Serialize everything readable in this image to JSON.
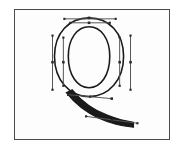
{
  "app": {
    "title": "Glyph Outline Editor",
    "view": "glyph-canvas"
  },
  "canvas": {
    "frame_label": "glyph editing canvas",
    "background_color": "#fdfdfd",
    "border_color": "#4a4a4a",
    "outline_color": "#1a1a1a",
    "handle_color": "#555555",
    "point_color": "#2b2b2b"
  },
  "glyph": {
    "character": "Q",
    "name": "Q",
    "style": "serif-capital",
    "description": "Capital letter Q outline with Bezier control points and handles"
  },
  "contours": [
    {
      "name": "outer-bowl",
      "path": "M 89 17 C 109 17 124 32 124 56 C 124 80 109 97 89 97 C 69 97 54 80 54 56 C 54 32 69 17 89 17 Z"
    },
    {
      "name": "inner-counter",
      "path": "M 89 26 C 101 26 110 38 110 56 C 110 75 101 88 89 88 C 77 88 68 75 68 56 C 68 38 77 26 89 26 Z"
    },
    {
      "name": "tail-stroke",
      "path": "M 72 90 C 80 100 92 110 108 116 C 118 120 126 122 134 123 L 134 128 C 122 127 110 124 99 119 C 84 112 73 102 66 93 Z"
    }
  ],
  "handles": [
    {
      "name": "handle-top-outer",
      "x1": 64,
      "y1": 18,
      "x2": 116,
      "y2": 18
    },
    {
      "name": "handle-top-inner",
      "x1": 70,
      "y1": 22,
      "x2": 110,
      "y2": 22
    },
    {
      "name": "handle-left-outer",
      "x1": 52,
      "y1": 35,
      "x2": 52,
      "y2": 90
    },
    {
      "name": "handle-left-inner",
      "x1": 63,
      "y1": 37,
      "x2": 63,
      "y2": 86
    },
    {
      "name": "handle-right-inner",
      "x1": 120,
      "y1": 37,
      "x2": 120,
      "y2": 86
    },
    {
      "name": "handle-right-outer",
      "x1": 131,
      "y1": 35,
      "x2": 131,
      "y2": 90
    },
    {
      "name": "handle-tail-upper",
      "x1": 68,
      "y1": 95,
      "x2": 112,
      "y2": 99
    },
    {
      "name": "handle-tail-lower",
      "x1": 86,
      "y1": 117,
      "x2": 138,
      "y2": 124
    }
  ],
  "control_points": [
    {
      "name": "point-top-left-handle",
      "x": 64,
      "y": 18,
      "type": "handle-end"
    },
    {
      "name": "point-top-apex",
      "x": 89,
      "y": 17,
      "type": "on-curve"
    },
    {
      "name": "point-top-right-handle",
      "x": 116,
      "y": 18,
      "type": "handle-end"
    },
    {
      "name": "point-inner-top-left",
      "x": 70,
      "y": 22,
      "type": "handle-end"
    },
    {
      "name": "point-inner-top-apex",
      "x": 89,
      "y": 22,
      "type": "on-curve"
    },
    {
      "name": "point-inner-top-right",
      "x": 110,
      "y": 22,
      "type": "handle-end"
    },
    {
      "name": "point-left-outer-top",
      "x": 52,
      "y": 35,
      "type": "handle-end"
    },
    {
      "name": "point-left-outer-mid",
      "x": 52,
      "y": 62,
      "type": "on-curve"
    },
    {
      "name": "point-left-outer-bottom",
      "x": 52,
      "y": 90,
      "type": "handle-end"
    },
    {
      "name": "point-left-inner-top",
      "x": 63,
      "y": 37,
      "type": "handle-end"
    },
    {
      "name": "point-left-inner-mid",
      "x": 63,
      "y": 62,
      "type": "on-curve"
    },
    {
      "name": "point-left-inner-bottom",
      "x": 63,
      "y": 86,
      "type": "handle-end"
    },
    {
      "name": "point-right-inner-top",
      "x": 120,
      "y": 37,
      "type": "handle-end"
    },
    {
      "name": "point-right-inner-mid",
      "x": 120,
      "y": 62,
      "type": "on-curve"
    },
    {
      "name": "point-right-inner-bottom",
      "x": 120,
      "y": 86,
      "type": "handle-end"
    },
    {
      "name": "point-right-outer-top",
      "x": 131,
      "y": 35,
      "type": "handle-end"
    },
    {
      "name": "point-right-outer-mid",
      "x": 131,
      "y": 62,
      "type": "on-curve"
    },
    {
      "name": "point-right-outer-bottom",
      "x": 131,
      "y": 90,
      "type": "handle-end"
    },
    {
      "name": "point-tail-start",
      "x": 68,
      "y": 95,
      "type": "on-curve"
    },
    {
      "name": "point-tail-mid",
      "x": 90,
      "y": 97,
      "type": "handle-end"
    },
    {
      "name": "point-tail-junction",
      "x": 112,
      "y": 99,
      "type": "on-curve"
    },
    {
      "name": "point-tail-lower-start",
      "x": 86,
      "y": 117,
      "type": "handle-end"
    },
    {
      "name": "point-tail-lower-mid",
      "x": 112,
      "y": 121,
      "type": "on-curve"
    },
    {
      "name": "point-tail-terminal",
      "x": 138,
      "y": 124,
      "type": "handle-end"
    }
  ]
}
